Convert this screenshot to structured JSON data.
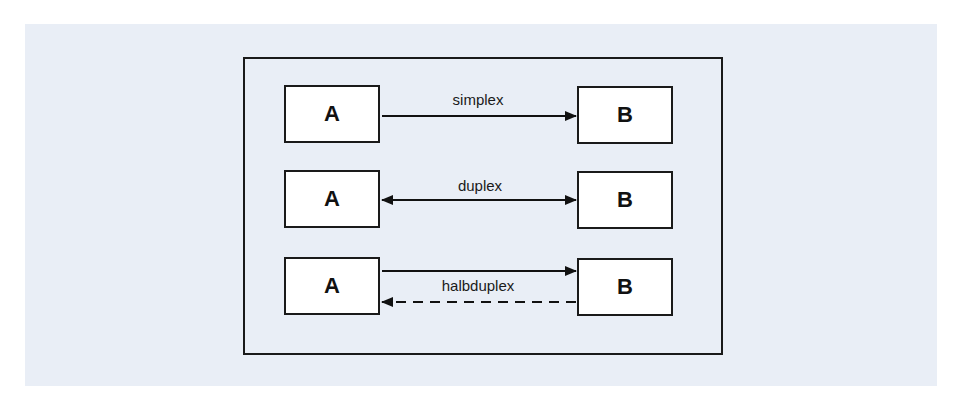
{
  "diagram": {
    "type": "communication-modes",
    "background_color": "#e9eef6",
    "rows": [
      {
        "mode": "simplex",
        "label": "simplex",
        "left_node": "A",
        "right_node": "B",
        "arrows": [
          {
            "from": "A",
            "to": "B",
            "style": "solid"
          }
        ]
      },
      {
        "mode": "duplex",
        "label": "duplex",
        "left_node": "A",
        "right_node": "B",
        "arrows": [
          {
            "from": "A",
            "to": "B",
            "style": "solid",
            "bidirectional": true
          }
        ]
      },
      {
        "mode": "halbduplex",
        "label": "halbduplex",
        "left_node": "A",
        "right_node": "B",
        "arrows": [
          {
            "from": "A",
            "to": "B",
            "style": "solid"
          },
          {
            "from": "B",
            "to": "A",
            "style": "dashed"
          }
        ]
      }
    ]
  }
}
